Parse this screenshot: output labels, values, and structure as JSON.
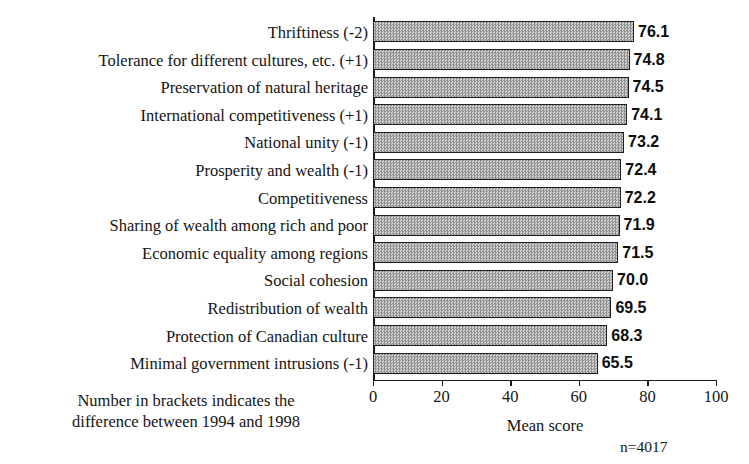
{
  "chart_data": {
    "type": "bar",
    "orientation": "horizontal",
    "title": "",
    "xlabel": "Mean score",
    "ylabel": "",
    "xlim": [
      0,
      100
    ],
    "xticks": [
      "0",
      "20",
      "40",
      "60",
      "80",
      "100"
    ],
    "grid": false,
    "legend": null,
    "categories": [
      "Thriftiness (-2)",
      "Tolerance for different cultures, etc. (+1)",
      "Preservation of natural heritage",
      "International competitiveness (+1)",
      "National unity (-1)",
      "Prosperity and wealth (-1)",
      "Competitiveness",
      "Sharing of wealth among rich and poor",
      "Economic equality among regions",
      "Social cohesion",
      "Redistribution of wealth",
      "Protection of Canadian culture",
      "Minimal government intrusions (-1)"
    ],
    "values": [
      76.1,
      74.8,
      74.5,
      74.1,
      73.2,
      72.4,
      72.2,
      71.9,
      71.5,
      70.0,
      69.5,
      68.3,
      65.5
    ],
    "value_labels": [
      "76.1",
      "74.8",
      "74.5",
      "74.1",
      "73.2",
      "72.4",
      "72.2",
      "71.9",
      "71.5",
      "70.0",
      "69.5",
      "68.3",
      "65.5"
    ],
    "annotations": {
      "footnote_line1": "Number in brackets indicates the",
      "footnote_line2": "difference between 1994 and 1998",
      "sample_size": "n=4017"
    },
    "colors": {
      "bar_fill": "#b6b6b6",
      "bar_pattern_light": "#d2d2d2",
      "bar_pattern_dark": "#8f8f8f",
      "bar_border": "#1f1f1f",
      "axis": "#1a1a1a",
      "text": "#141414",
      "background": "#ffffff"
    }
  }
}
